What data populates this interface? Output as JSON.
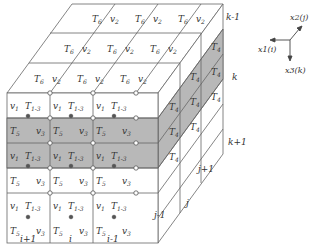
{
  "diagram": {
    "front_face": {
      "columns": [
        "i+1",
        "i",
        "i-1"
      ],
      "rows": [
        {
          "left": "v1",
          "right": "T1-3",
          "shaded": false
        },
        {
          "left": "T5",
          "right": "v3",
          "shaded": true
        },
        {
          "left": "v1",
          "right": "T1-3",
          "shaded": true
        },
        {
          "left": "T5",
          "right": "v3",
          "shaded": false
        },
        {
          "left": "v1",
          "right": "T1-3",
          "shaded": false
        },
        {
          "left": "T5",
          "right": "v3",
          "shaded": false
        }
      ]
    },
    "top_face": {
      "cell_label_left": "T6",
      "cell_label_right": "v2"
    },
    "side_face": {
      "cell_label": "T4",
      "j_labels": [
        "j-1",
        "j",
        "j+1"
      ],
      "k_labels": [
        "k-1",
        "k",
        "k+1"
      ]
    },
    "axes": {
      "x1": "x1(i)",
      "x2": "x2(j)",
      "x3": "x3(k)"
    },
    "colors": {
      "line": "#555555",
      "shade": "#b8b8b8",
      "node_open": "#ffffff",
      "node_filled": "#555555"
    }
  }
}
